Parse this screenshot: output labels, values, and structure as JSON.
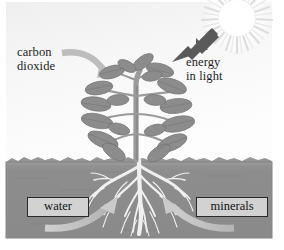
{
  "diagram": {
    "background_color": "#ffffff",
    "sky_color_top": "#f4f4f4",
    "sky_color_bottom": "#fbfbfb",
    "soil_color": "#8e8e8e",
    "soil_shadow_color": "#7a7a7a",
    "plant_color": "#8a8a8a",
    "plant_stem_color": "#9a9a9a",
    "root_color": "#f2f2f2",
    "sun_color": "#ffffff",
    "sun_ray_color": "#e2e2e2",
    "light_arrow_color": "#555555",
    "pale_arrow_color": "#bdbdbd",
    "label_box_fill": "#d2d2d2",
    "label_box_border": "#2a2a2a",
    "text_color": "#1d1d1d"
  },
  "labels": {
    "carbon_dioxide": "carbon\ndioxide",
    "energy_in_light": "energy\nin light",
    "water": "water",
    "minerals": "minerals"
  },
  "icons": {
    "sun": "sun-icon",
    "plant": "plant-icon",
    "roots": "roots-icon",
    "light_arrow": "arrow-down-left-icon",
    "carbon_dioxide_arrow": "curved-arrow-right-icon",
    "water_arrow": "curved-arrow-up-right-icon",
    "minerals_arrow": "curved-arrow-up-left-icon"
  }
}
